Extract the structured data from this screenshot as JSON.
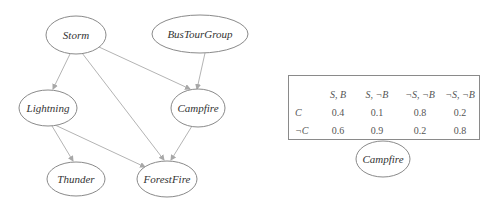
{
  "graph": {
    "nodes": [
      {
        "id": "storm",
        "label": "Storm",
        "cx": 76,
        "cy": 35,
        "rx": 30,
        "ry": 19
      },
      {
        "id": "bustourgroup",
        "label": "BusTourGroup",
        "cx": 200,
        "cy": 34,
        "rx": 48,
        "ry": 19
      },
      {
        "id": "lightning",
        "label": "Lightning",
        "cx": 48,
        "cy": 108,
        "rx": 29,
        "ry": 18
      },
      {
        "id": "campfire",
        "label": "Campfire",
        "cx": 198,
        "cy": 108,
        "rx": 27,
        "ry": 19
      },
      {
        "id": "thunder",
        "label": "Thunder",
        "cx": 76,
        "cy": 179,
        "rx": 29,
        "ry": 17
      },
      {
        "id": "forestfire",
        "label": "ForestFire",
        "cx": 167,
        "cy": 179,
        "rx": 30,
        "ry": 18
      }
    ],
    "edges": [
      {
        "from": "Storm",
        "to": "Lightning"
      },
      {
        "from": "Storm",
        "to": "Campfire"
      },
      {
        "from": "Storm",
        "to": "ForestFire"
      },
      {
        "from": "BusTourGroup",
        "to": "Campfire"
      },
      {
        "from": "Lightning",
        "to": "Thunder"
      },
      {
        "from": "Lightning",
        "to": "ForestFire"
      },
      {
        "from": "Campfire",
        "to": "ForestFire"
      }
    ]
  },
  "cpt": {
    "node_label": "Campfire",
    "columns": [
      "S, B",
      "S, ¬B",
      "¬S, ¬B",
      "¬S, ¬B"
    ],
    "rows": [
      {
        "label": "C",
        "values": [
          "0.4",
          "0.1",
          "0.8",
          "0.2"
        ]
      },
      {
        "label": "¬C",
        "values": [
          "0.6",
          "0.9",
          "0.2",
          "0.8"
        ]
      }
    ]
  },
  "colors": {
    "node_stroke": "#8a8a8a",
    "edge_stroke": "#b4b4b4",
    "text": "#333333"
  }
}
